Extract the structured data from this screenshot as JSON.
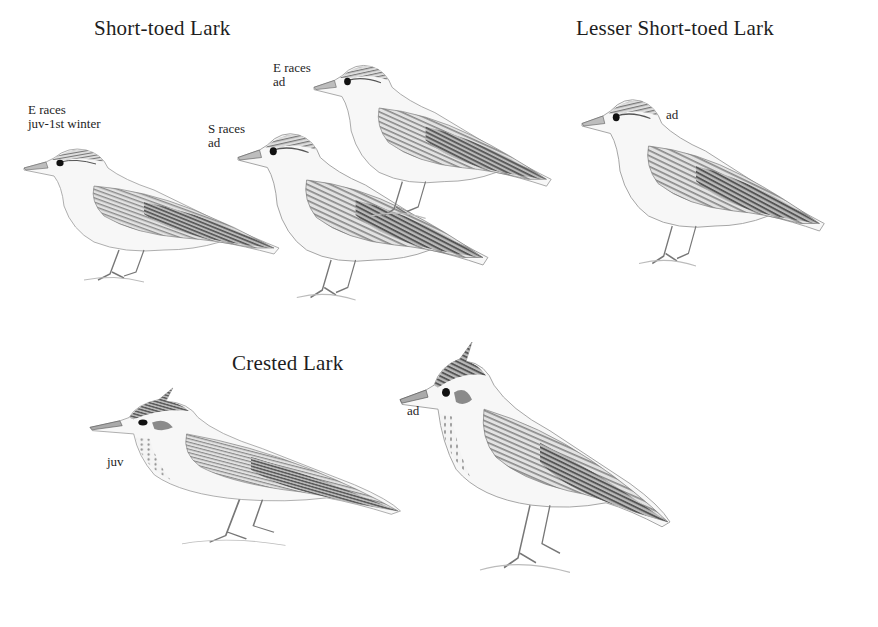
{
  "plate": {
    "species": [
      {
        "name": "Short-toed Lark",
        "figures": [
          {
            "label_lines": [
              "E races",
              "juv-1st winter"
            ]
          },
          {
            "label_lines": [
              "S races",
              "ad"
            ]
          },
          {
            "label_lines": [
              "E races",
              "ad"
            ]
          }
        ]
      },
      {
        "name": "Lesser Short-toed Lark",
        "figures": [
          {
            "label_lines": [
              "ad"
            ]
          }
        ]
      },
      {
        "name": "Crested Lark",
        "figures": [
          {
            "label_lines": [
              "juv"
            ]
          },
          {
            "label_lines": [
              "ad"
            ]
          }
        ]
      }
    ]
  }
}
